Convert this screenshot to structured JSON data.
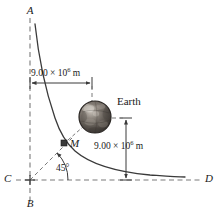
{
  "figure": {
    "axes": {
      "top_label": "A",
      "bottom_label": "B",
      "left_label": "C",
      "right_label": "D"
    },
    "labels": {
      "earth": "Earth",
      "point_m": "M",
      "angle": "45°",
      "horizontal_distance": "9.00 × 10",
      "horizontal_distance_exp": "6",
      "horizontal_distance_unit": " m",
      "vertical_distance": "9.00 × 10",
      "vertical_distance_exp": "6",
      "vertical_distance_unit": " m"
    },
    "colors": {
      "line": "#3a3a3a",
      "dashed": "#7a7a7a",
      "earth_dark": "#3b3531",
      "earth_mid": "#6d6761",
      "earth_light": "#b4aea6",
      "text": "#1a1a1a"
    },
    "geometry": {
      "origin_x": 30,
      "origin_y": 180,
      "vertical_axis_top": 18,
      "vertical_axis_bottom": 205,
      "horizontal_axis_left": 16,
      "horizontal_axis_right": 200,
      "earth_center_x": 95,
      "earth_center_y": 117,
      "earth_radius": 16,
      "point_m_x": 64,
      "point_m_y": 143,
      "top_dim_y": 83,
      "top_dim_x1": 30,
      "top_dim_x2": 92,
      "right_dim_x": 126,
      "right_dim_y1": 118,
      "right_dim_y2": 180
    }
  }
}
